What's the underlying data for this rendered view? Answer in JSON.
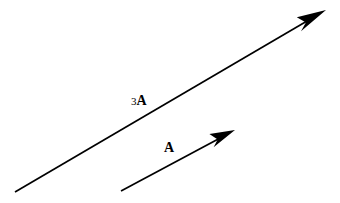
{
  "figure": {
    "width": 340,
    "height": 203,
    "background_color": "#ffffff",
    "ink_color": "#000000"
  },
  "vectors": [
    {
      "id": "long-vector",
      "name": "three-a-vector",
      "label_prefix": "3",
      "label_symbol": "A",
      "label_text": "3A",
      "magnitude_multiplier": 3,
      "tail": {
        "x": 15,
        "y": 192
      },
      "tip": {
        "x": 326,
        "y": 10
      },
      "length_px": 360,
      "angle_deg": 30.3,
      "color": "#000000",
      "stroke_width": 1.7,
      "label_position": {
        "x": 131,
        "y": 92
      }
    },
    {
      "id": "short-vector",
      "name": "a-vector",
      "label_prefix": "",
      "label_symbol": "A",
      "label_text": "A",
      "magnitude_multiplier": 1,
      "tail": {
        "x": 121,
        "y": 191
      },
      "tip": {
        "x": 235,
        "y": 130
      },
      "length_px": 129,
      "angle_deg": 28.2,
      "color": "#000000",
      "stroke_width": 1.7,
      "label_position": {
        "x": 164,
        "y": 139
      }
    }
  ],
  "labels": {
    "long_vector_number": "3",
    "long_vector_symbol": "A",
    "short_vector_symbol": "A"
  }
}
